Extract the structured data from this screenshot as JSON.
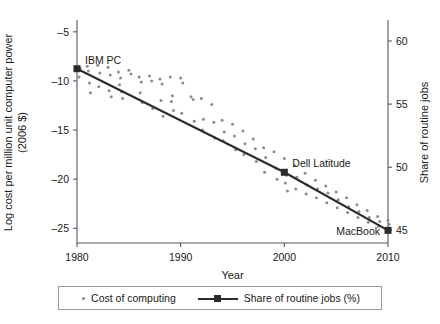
{
  "chart_data": {
    "type": "scatter",
    "title": "",
    "xlabel": "Year",
    "ylabel": "Log cost per million unit computer power (2006 $)",
    "ylabel_right": "Share of routine jobs",
    "xlim": [
      1980,
      2010
    ],
    "ylim": [
      -26.5,
      -4.0
    ],
    "ylim_right": [
      44.0,
      61.5
    ],
    "grid": false,
    "legend_position": "bottom-center",
    "xticks": [
      1980,
      1990,
      2000,
      2010
    ],
    "xtick_labels": [
      "1980",
      "1990",
      "2000",
      "2010"
    ],
    "yticks": [
      -5,
      -10,
      -15,
      -20,
      -25
    ],
    "ytick_labels": [
      "–5",
      "–10",
      "–15",
      "–20",
      "–25"
    ],
    "yticks_right": [
      60,
      55,
      50,
      45
    ],
    "ytick_labels_right": [
      "60",
      "55",
      "50",
      "45"
    ],
    "legend": [
      {
        "label": "Cost of computing",
        "marker": "dot",
        "color": "#8c8c8e"
      },
      {
        "label": "Share of routine jobs (%)",
        "marker": "line-square",
        "color": "#2b2b2b"
      }
    ],
    "series": [
      {
        "name": "Share of routine jobs (%)",
        "type": "line",
        "color": "#2b2b2b",
        "x": [
          1980,
          2000,
          2010
        ],
        "values": [
          57.8,
          49.6,
          45.0
        ],
        "marker_points": [
          {
            "x": 1980,
            "y": 57.8,
            "label": "IBM PC"
          },
          {
            "x": 2000,
            "y": 49.6,
            "label": "Dell Latitude"
          },
          {
            "x": 2010,
            "y": 45.0,
            "label": "MacBook"
          }
        ]
      },
      {
        "name": "Cost of computing",
        "type": "scatter",
        "color": "#8c8c8e",
        "points": [
          [
            1980.0,
            -8.6
          ],
          [
            1980.3,
            -8.7
          ],
          [
            1980.2,
            -9.6
          ],
          [
            1981.0,
            -8.5
          ],
          [
            1981.1,
            -9.0
          ],
          [
            1981.2,
            -10.2
          ],
          [
            1981.3,
            -11.2
          ],
          [
            1982.0,
            -8.4
          ],
          [
            1982.2,
            -9.2
          ],
          [
            1982.1,
            -10.6
          ],
          [
            1983.0,
            -8.6
          ],
          [
            1983.2,
            -9.4
          ],
          [
            1983.1,
            -11.0
          ],
          [
            1983.3,
            -11.6
          ],
          [
            1984.0,
            -9.1
          ],
          [
            1984.2,
            -9.7
          ],
          [
            1984.1,
            -10.4
          ],
          [
            1984.3,
            -11.1
          ],
          [
            1984.4,
            -11.8
          ],
          [
            1985.0,
            -8.9
          ],
          [
            1985.2,
            -9.3
          ],
          [
            1986.0,
            -9.6
          ],
          [
            1986.2,
            -10.1
          ],
          [
            1986.1,
            -11.2
          ],
          [
            1986.3,
            -12.2
          ],
          [
            1987.0,
            -9.5
          ],
          [
            1987.2,
            -10.0
          ],
          [
            1987.3,
            -12.8
          ],
          [
            1988.0,
            -9.8
          ],
          [
            1988.2,
            -10.3
          ],
          [
            1988.1,
            -12.0
          ],
          [
            1988.3,
            -13.6
          ],
          [
            1989.0,
            -9.6
          ],
          [
            1989.2,
            -11.5
          ],
          [
            1989.1,
            -12.1
          ],
          [
            1989.3,
            -13.0
          ],
          [
            1990.0,
            -9.7
          ],
          [
            1990.2,
            -10.2
          ],
          [
            1990.1,
            -13.3
          ],
          [
            1991.0,
            -11.6
          ],
          [
            1991.2,
            -11.9
          ],
          [
            1991.3,
            -14.1
          ],
          [
            1992.0,
            -11.8
          ],
          [
            1992.2,
            -13.9
          ],
          [
            1992.1,
            -15.0
          ],
          [
            1993.0,
            -12.4
          ],
          [
            1993.2,
            -14.2
          ],
          [
            1993.3,
            -15.8
          ],
          [
            1994.0,
            -14.0
          ],
          [
            1994.2,
            -15.2
          ],
          [
            1994.1,
            -16.1
          ],
          [
            1995.0,
            -14.4
          ],
          [
            1995.2,
            -15.6
          ],
          [
            1995.3,
            -17.0
          ],
          [
            1996.0,
            -15.1
          ],
          [
            1996.2,
            -16.4
          ],
          [
            1996.1,
            -17.5
          ],
          [
            1997.0,
            -15.9
          ],
          [
            1997.2,
            -16.9
          ],
          [
            1997.3,
            -18.2
          ],
          [
            1998.0,
            -16.8
          ],
          [
            1998.2,
            -17.8
          ],
          [
            1998.1,
            -19.3
          ],
          [
            1999.0,
            -17.2
          ],
          [
            1999.2,
            -18.9
          ],
          [
            1999.3,
            -20.0
          ],
          [
            2000.0,
            -17.9
          ],
          [
            2000.2,
            -19.6
          ],
          [
            2000.1,
            -20.4
          ],
          [
            2000.3,
            -21.2
          ],
          [
            2001.0,
            -18.6
          ],
          [
            2001.2,
            -19.8
          ],
          [
            2001.1,
            -21.0
          ],
          [
            2002.0,
            -19.4
          ],
          [
            2002.2,
            -20.6
          ],
          [
            2002.1,
            -21.5
          ],
          [
            2003.0,
            -20.1
          ],
          [
            2003.2,
            -21.0
          ],
          [
            2003.1,
            -21.9
          ],
          [
            2004.0,
            -20.7
          ],
          [
            2004.2,
            -21.4
          ],
          [
            2004.1,
            -22.4
          ],
          [
            2005.0,
            -21.3
          ],
          [
            2005.2,
            -22.1
          ],
          [
            2005.1,
            -22.9
          ],
          [
            2006.0,
            -21.9
          ],
          [
            2006.2,
            -22.8
          ],
          [
            2006.1,
            -23.4
          ],
          [
            2007.0,
            -22.6
          ],
          [
            2007.2,
            -23.3
          ],
          [
            2007.1,
            -23.9
          ],
          [
            2008.0,
            -23.2
          ],
          [
            2008.2,
            -23.9
          ],
          [
            2008.1,
            -24.4
          ],
          [
            2009.0,
            -23.8
          ],
          [
            2009.2,
            -24.3
          ],
          [
            2009.1,
            -24.8
          ],
          [
            2010.0,
            -24.2
          ],
          [
            2010.1,
            -24.6
          ],
          [
            2010.2,
            -25.1
          ]
        ]
      }
    ],
    "annotations": [
      {
        "text": "IBM PC",
        "x": 1980,
        "y": -7.8
      },
      {
        "text": "Dell Latitude",
        "x": 2000,
        "y": -19.2
      },
      {
        "text": "MacBook",
        "x": 2010,
        "y": -25.0
      }
    ]
  }
}
